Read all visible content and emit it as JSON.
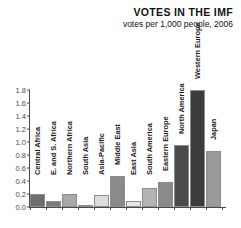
{
  "header": {
    "title": "VOTES IN THE IMF",
    "subtitle": "votes per 1,000 people, 2006"
  },
  "chart_data": {
    "type": "bar",
    "title": "VOTES IN THE IMF",
    "subtitle": "votes per 1,000 people, 2006",
    "xlabel": "",
    "ylabel": "",
    "ylim": [
      0.0,
      1.8
    ],
    "ytick_labels": [
      "0.0",
      "0.2",
      "0.4",
      "0.6",
      "0.8",
      "1.0",
      "1.2",
      "1.4",
      "1.6",
      "1.8"
    ],
    "ytick_values": [
      0.0,
      0.2,
      0.4,
      0.6,
      0.8,
      1.0,
      1.2,
      1.4,
      1.6,
      1.8
    ],
    "grid": false,
    "legend": "none",
    "categories": [
      "Central Africa",
      "E. and S. Africa",
      "Northern Africa",
      "South Asia",
      "Asia-Pacific",
      "Middle East",
      "East Asia",
      "South America",
      "Eastern Europe",
      "North America",
      "Western Europe",
      "Japan"
    ],
    "values": [
      0.2,
      0.1,
      0.2,
      0.02,
      0.19,
      0.48,
      0.1,
      0.29,
      0.39,
      0.95,
      1.8,
      0.86
    ],
    "bar_colors": [
      "#6e6e6e",
      "#7a7a7a",
      "#a8a8a8",
      "#f2f2f2",
      "#dcdcdc",
      "#8a8a8a",
      "#e6e6e6",
      "#b4b4b4",
      "#8a8a8a",
      "#4a4a4a",
      "#3c3c3c",
      "#9a9a9a"
    ],
    "bars": [
      {
        "label": "Central Africa",
        "value": 0.2,
        "color": "#6e6e6e"
      },
      {
        "label": "E. and S. Africa",
        "value": 0.1,
        "color": "#7a7a7a"
      },
      {
        "label": "Northern Africa",
        "value": 0.2,
        "color": "#a8a8a8"
      },
      {
        "label": "South Asia",
        "value": 0.02,
        "color": "#f2f2f2"
      },
      {
        "label": "Asia-Pacific",
        "value": 0.19,
        "color": "#dcdcdc"
      },
      {
        "label": "Middle East",
        "value": 0.48,
        "color": "#8a8a8a"
      },
      {
        "label": "East Asia",
        "value": 0.1,
        "color": "#e6e6e6"
      },
      {
        "label": "South America",
        "value": 0.29,
        "color": "#b4b4b4"
      },
      {
        "label": "Eastern Europe",
        "value": 0.39,
        "color": "#8a8a8a"
      },
      {
        "label": "North America",
        "value": 0.95,
        "color": "#4a4a4a"
      },
      {
        "label": "Western Europe",
        "value": 1.8,
        "color": "#3c3c3c"
      },
      {
        "label": "Japan",
        "value": 0.86,
        "color": "#9a9a9a"
      }
    ],
    "colors": {
      "axis": "#4a4a4a",
      "tick_text": "#4a4a4a",
      "title_text": "#111111",
      "label_text": "#1a1a1a",
      "background": "#ffffff"
    }
  }
}
